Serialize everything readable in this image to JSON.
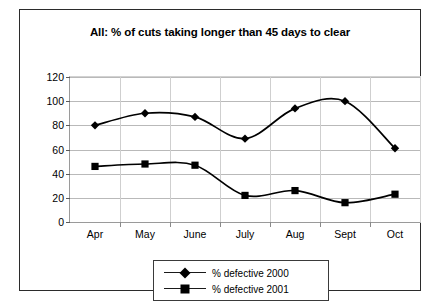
{
  "chart_data": {
    "type": "line",
    "title": "All:  % of cuts taking longer than 45 days to clear",
    "xlabel": "",
    "ylabel": "",
    "categories": [
      "Apr",
      "May",
      "June",
      "July",
      "Aug",
      "Sept",
      "Oct"
    ],
    "series": [
      {
        "name": "% defective 2000",
        "marker": "diamond",
        "color": "#000000",
        "values": [
          80,
          90,
          87,
          69,
          94,
          100,
          61
        ]
      },
      {
        "name": "% defective 2001",
        "marker": "square",
        "color": "#000000",
        "values": [
          46,
          48,
          47,
          22,
          26,
          16,
          23
        ]
      }
    ],
    "ylim": [
      0,
      120
    ],
    "yticks": [
      0,
      20,
      40,
      60,
      80,
      100,
      120
    ],
    "ytick_labels": [
      "0",
      "20",
      "40",
      "60",
      "80",
      "100",
      "120"
    ],
    "grid": true,
    "legend_position": "bottom-center"
  },
  "legend": {
    "entries": [
      {
        "label": "% defective 2000",
        "marker": "diamond-icon"
      },
      {
        "label": "% defective 2001",
        "marker": "square-icon"
      }
    ]
  }
}
